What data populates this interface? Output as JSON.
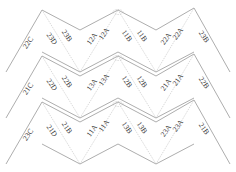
{
  "diagram": {
    "type": "folded-zigzag-strips",
    "stroke_color": "#8a8a8a",
    "text_color": "#333333",
    "strips": [
      {
        "id": "strip-1",
        "offset_y": 0,
        "labels": [
          {
            "text": "22C",
            "x": 30,
            "y": 44,
            "rot": -55
          },
          {
            "text": "23D",
            "x": 50,
            "y": 40,
            "rot": 55
          },
          {
            "text": "23B",
            "x": 65,
            "y": 37,
            "rot": 55
          },
          {
            "text": "12A",
            "x": 94,
            "y": 40,
            "rot": -55
          },
          {
            "text": "12A",
            "x": 106,
            "y": 35,
            "rot": -55
          },
          {
            "text": "11B",
            "x": 125,
            "y": 37,
            "rot": 55
          },
          {
            "text": "11B",
            "x": 140,
            "y": 37,
            "rot": 55
          },
          {
            "text": "22A",
            "x": 168,
            "y": 40,
            "rot": -55
          },
          {
            "text": "22A",
            "x": 180,
            "y": 35,
            "rot": -55
          },
          {
            "text": "23B",
            "x": 202,
            "y": 38,
            "rot": 55
          }
        ]
      },
      {
        "id": "strip-2",
        "offset_y": 46,
        "labels": [
          {
            "text": "21C",
            "x": 30,
            "y": 44,
            "rot": -55
          },
          {
            "text": "22D",
            "x": 50,
            "y": 40,
            "rot": 55
          },
          {
            "text": "22B",
            "x": 65,
            "y": 37,
            "rot": 55
          },
          {
            "text": "13A",
            "x": 94,
            "y": 40,
            "rot": -55
          },
          {
            "text": "13A",
            "x": 106,
            "y": 35,
            "rot": -55
          },
          {
            "text": "12B",
            "x": 125,
            "y": 37,
            "rot": 55
          },
          {
            "text": "12B",
            "x": 140,
            "y": 37,
            "rot": 55
          },
          {
            "text": "21A",
            "x": 168,
            "y": 40,
            "rot": -55
          },
          {
            "text": "21A",
            "x": 180,
            "y": 35,
            "rot": -55
          },
          {
            "text": "22B",
            "x": 202,
            "y": 38,
            "rot": 55
          }
        ]
      },
      {
        "id": "strip-3",
        "offset_y": 92,
        "labels": [
          {
            "text": "23C",
            "x": 30,
            "y": 44,
            "rot": -55
          },
          {
            "text": "21D",
            "x": 50,
            "y": 40,
            "rot": 55
          },
          {
            "text": "21B",
            "x": 65,
            "y": 37,
            "rot": 55
          },
          {
            "text": "11A",
            "x": 94,
            "y": 40,
            "rot": -55
          },
          {
            "text": "11A",
            "x": 106,
            "y": 35,
            "rot": -55
          },
          {
            "text": "13B",
            "x": 125,
            "y": 37,
            "rot": 55
          },
          {
            "text": "13B",
            "x": 140,
            "y": 37,
            "rot": 55
          },
          {
            "text": "23A",
            "x": 168,
            "y": 40,
            "rot": -55
          },
          {
            "text": "23A",
            "x": 180,
            "y": 35,
            "rot": -55
          },
          {
            "text": "21B",
            "x": 202,
            "y": 38,
            "rot": 55
          }
        ]
      }
    ]
  }
}
